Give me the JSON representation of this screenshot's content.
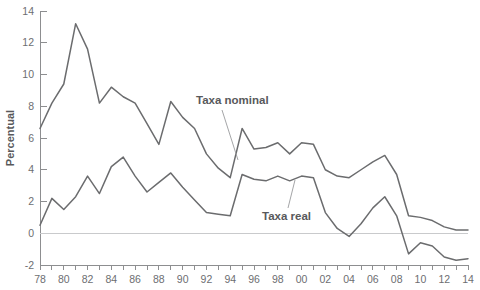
{
  "chart_data": {
    "type": "line",
    "title": "",
    "xlabel": "",
    "ylabel": "Percentual",
    "ylim": [
      -2,
      14
    ],
    "ytick_values": [
      -2,
      0,
      2,
      4,
      6,
      8,
      10,
      12,
      14
    ],
    "ytick_labels": [
      "-2",
      "0",
      "2",
      "4",
      "6",
      "8",
      "10",
      "12",
      "14"
    ],
    "xlim": [
      1978,
      2014
    ],
    "x": [
      1978,
      1979,
      1980,
      1981,
      1982,
      1983,
      1984,
      1985,
      1986,
      1987,
      1988,
      1989,
      1990,
      1991,
      1992,
      1993,
      1994,
      1995,
      1996,
      1997,
      1998,
      1999,
      2000,
      2001,
      2002,
      2003,
      2004,
      2005,
      2006,
      2007,
      2008,
      2009,
      2010,
      2011,
      2012,
      2013,
      2014
    ],
    "xtick_values": [
      1978,
      1980,
      1982,
      1984,
      1986,
      1988,
      1990,
      1992,
      1994,
      1996,
      1998,
      2000,
      2002,
      2004,
      2006,
      2008,
      2010,
      2012,
      2014
    ],
    "xtick_labels": [
      "78",
      "80",
      "82",
      "84",
      "86",
      "88",
      "90",
      "92",
      "94",
      "96",
      "98",
      "00",
      "02",
      "04",
      "06",
      "08",
      "10",
      "12",
      "14"
    ],
    "grid": false,
    "legend_position": "inline-annotations",
    "zero_reference_line": 0,
    "series": [
      {
        "name": "Taxa nominal",
        "color": "#6b6c6e",
        "values": [
          6.6,
          8.2,
          9.4,
          13.2,
          11.6,
          8.2,
          9.2,
          8.6,
          8.2,
          6.9,
          5.6,
          8.3,
          7.3,
          6.6,
          5.0,
          4.1,
          3.5,
          6.6,
          5.3,
          5.4,
          5.7,
          5.0,
          5.7,
          5.6,
          4.0,
          3.6,
          3.5,
          4.0,
          4.5,
          4.9,
          3.7,
          1.1,
          1.0,
          0.8,
          0.4,
          0.2,
          0.2
        ]
      },
      {
        "name": "Taxa real",
        "color": "#6b6c6e",
        "values": [
          0.5,
          2.2,
          1.5,
          2.3,
          3.6,
          2.5,
          4.2,
          4.8,
          3.6,
          2.6,
          3.2,
          3.8,
          2.9,
          2.1,
          1.3,
          1.2,
          1.1,
          3.7,
          3.4,
          3.3,
          3.6,
          3.3,
          3.6,
          3.5,
          1.3,
          0.3,
          -0.2,
          0.6,
          1.6,
          2.3,
          1.1,
          -1.3,
          -0.6,
          -0.8,
          -1.5,
          -1.7,
          -1.6
        ]
      }
    ],
    "annotations": [
      {
        "text": "Taxa nominal",
        "label_x": 196,
        "label_y": 104,
        "leader_from_x": 222,
        "leader_from_y": 110,
        "leader_to_x": 238,
        "leader_to_y": 160
      },
      {
        "text": "Taxa real",
        "label_x": 262,
        "label_y": 220,
        "leader_from_x": 288,
        "leader_from_y": 208,
        "leader_to_x": 295,
        "leader_to_y": 180
      }
    ]
  }
}
